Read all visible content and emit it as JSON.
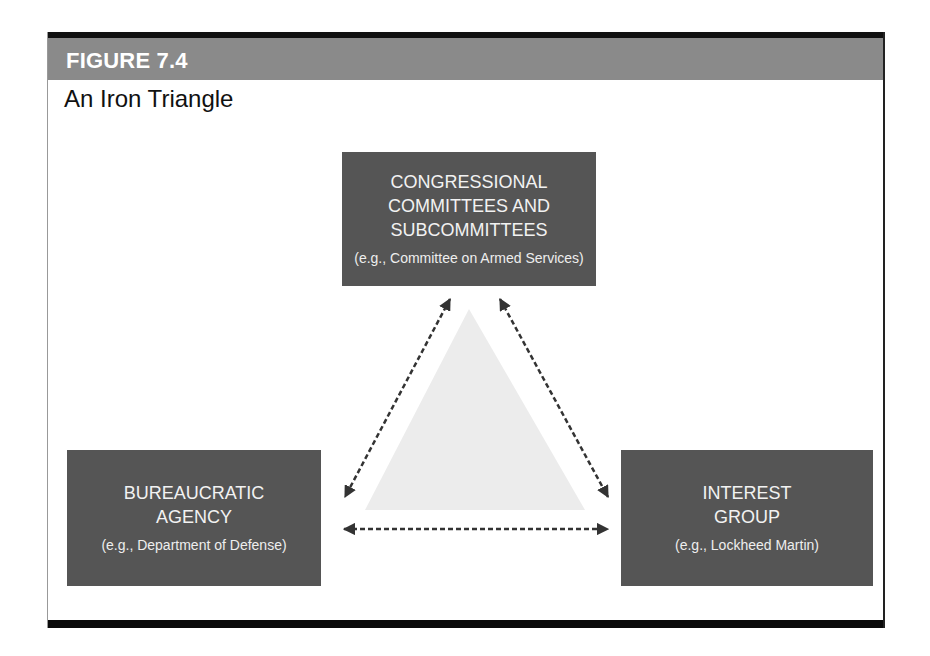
{
  "figure": {
    "label": "FIGURE 7.4",
    "title": "An Iron Triangle"
  },
  "nodes": {
    "top": {
      "lines": [
        "CONGRESSIONAL",
        "COMMITTEES AND",
        "SUBCOMMITTEES"
      ],
      "example": "(e.g., Committee on Armed Services)"
    },
    "left": {
      "lines": [
        "BUREAUCRATIC",
        "AGENCY"
      ],
      "example": "(e.g., Department of Defense)"
    },
    "right": {
      "lines": [
        "INTEREST",
        "GROUP"
      ],
      "example": "(e.g., Lockheed Martin)"
    }
  },
  "edges": [
    {
      "from": "top",
      "to": "left",
      "style": "dashed",
      "direction": "bidirectional"
    },
    {
      "from": "top",
      "to": "right",
      "style": "dashed",
      "direction": "bidirectional"
    },
    {
      "from": "left",
      "to": "right",
      "style": "dashed",
      "direction": "bidirectional"
    }
  ],
  "colors": {
    "header_bar": "#8a8a8a",
    "node_fill": "#555555",
    "node_text": "#f2f2f2",
    "center_triangle": "#ececec",
    "arrow": "#333333"
  }
}
